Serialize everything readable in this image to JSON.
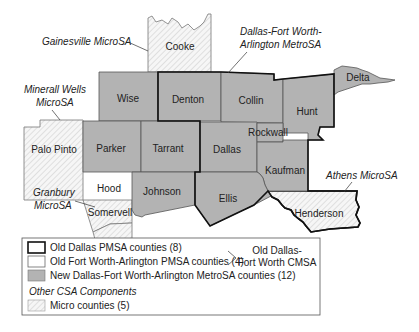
{
  "map": {
    "title": "Dallas-Fort Worth Combined Statistical Area",
    "colors": {
      "metro_fill": "#b3b3b3",
      "micro_fill": "#f4f4f4",
      "hatch": "#c8c8c8",
      "thin_border": "#555555",
      "thick_border": "#111111"
    },
    "counties": {
      "cooke": "Cooke",
      "wise": "Wise",
      "denton": "Denton",
      "collin": "Collin",
      "hunt": "Hunt",
      "delta": "Delta",
      "palo_pinto": "Palo Pinto",
      "parker": "Parker",
      "tarrant": "Tarrant",
      "dallas": "Dallas",
      "rockwall": "Rockwall",
      "kaufman": "Kaufman",
      "hood": "Hood",
      "johnson": "Johnson",
      "ellis": "Ellis",
      "somervell": "Somervell",
      "henderson": "Henderson"
    },
    "callouts": {
      "gainesville": "Gainesville MicroSA",
      "mineral_wells_1": "Minerall Wells",
      "mineral_wells_2": "MicroSA",
      "dfw_1": "Dallas-Fort Worth-",
      "dfw_2": "Arlington MetroSA",
      "granbury_1": "Granbury",
      "granbury_2": "MicroSA",
      "athens": "Athens MicroSA"
    }
  },
  "legend": {
    "items": [
      {
        "label": "Old Dallas PMSA counties (8)",
        "swatch": "thick-outline"
      },
      {
        "label": "Old Fort Worth-Arlington PMSA counties (4)",
        "swatch": "thin-outline"
      },
      {
        "label": "New Dallas-Fort Worth-Arlington MetroSA counties (12)",
        "swatch": "gray-fill"
      }
    ],
    "bracket_label_1": "Old Dallas-",
    "bracket_label_2": "Fort Worth CMSA",
    "section_heading": "Other CSA Components",
    "micro_item": {
      "label": "Micro counties (5)",
      "swatch": "hatched"
    }
  }
}
